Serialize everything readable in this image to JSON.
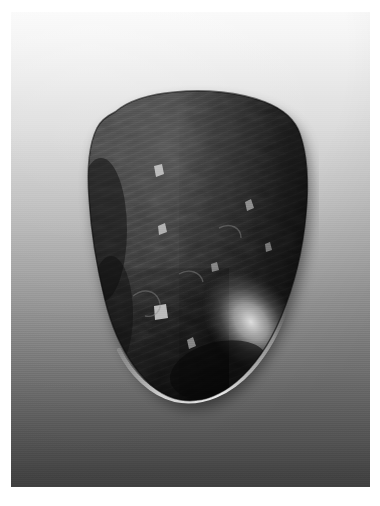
{
  "document": {
    "kind": "photograph",
    "title": "Dark polished stone artifact",
    "color_mode": "grayscale",
    "caption": "",
    "border_color": "#ffffff"
  },
  "photo": {
    "name": "stone-photograph",
    "subject": "stone",
    "background": {
      "description": "smooth vertical studio gradient, light at top to dark at bottom",
      "top_color": "#fafafa",
      "mid_color": "#a6a6a6",
      "bottom_color": "#474747"
    },
    "plate": {
      "left": 11,
      "top": 12,
      "width": 359,
      "height": 475
    }
  },
  "stone": {
    "name": "stone-subject",
    "shape": "rounded irregular triangular pebble, broad flat top edge tapering to a rounded point at the lower right",
    "surface": "dark mottled gray with fine diagonal striations and scattered bright mineral speckles",
    "body_color": "#2b2b2b",
    "shadow_color": "#111111",
    "highlight_color": "#d8d8d8",
    "speckle_color": "#cfcfcf",
    "bounds": {
      "left": 48,
      "top": 66,
      "width": 260,
      "height": 345
    },
    "features": [
      {
        "name": "top-edge",
        "note": "broad, gently domed, lightest along its crest"
      },
      {
        "name": "left-bulge",
        "note": "rounded protrusion on the mid-left flank"
      },
      {
        "name": "specular-highlight",
        "note": "large bright gloss patch on the lower-right shoulder"
      },
      {
        "name": "bottom-rim-highlight",
        "note": "thin bright crescent outlining the lower contour"
      },
      {
        "name": "mineral-speckles",
        "note": "dense pale inclusions concentrated in the upper-right quadrant"
      }
    ]
  }
}
